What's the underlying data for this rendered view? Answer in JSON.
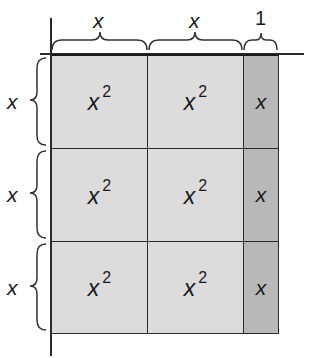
{
  "diagram": {
    "column_labels": [
      "x",
      "x",
      "1"
    ],
    "row_labels": [
      "x",
      "x",
      "x"
    ],
    "cells": [
      [
        "x",
        "x",
        "x"
      ],
      [
        "x",
        "x",
        "x"
      ],
      [
        "x",
        "x",
        "x"
      ]
    ],
    "cell_exponents": [
      [
        "2",
        "2",
        ""
      ],
      [
        "2",
        "2",
        ""
      ],
      [
        "2",
        "2",
        ""
      ]
    ],
    "colors": {
      "square_fill": "#dcdcdc",
      "rect_fill": "#b8b8b8",
      "line": "#2a2a2a"
    }
  }
}
